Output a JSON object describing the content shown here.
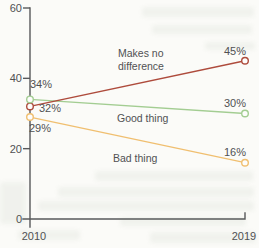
{
  "figure": {
    "background": "#fbfbf8"
  },
  "chart_data": {
    "type": "line",
    "x": [
      2010,
      2019
    ],
    "x_tick_labels": [
      "2010",
      "2019"
    ],
    "y_ticks": [
      0,
      20,
      40,
      60
    ],
    "ylim": [
      0,
      60
    ],
    "grid": false,
    "legend_position": "inline-labels",
    "axis_color": "#58595b",
    "text_color": "#505153",
    "marker_fill": "#fdfdfc",
    "series": [
      {
        "name": "Makes no difference",
        "label_lines": [
          "Makes no",
          "difference"
        ],
        "values": [
          32,
          45
        ],
        "point_labels": [
          "32%",
          "45%"
        ],
        "color": "#ae4b3c"
      },
      {
        "name": "Good thing",
        "label_lines": [
          "Good thing"
        ],
        "values": [
          34,
          30
        ],
        "point_labels": [
          "34%",
          "30%"
        ],
        "color": "#a3cd92"
      },
      {
        "name": "Bad thing",
        "label_lines": [
          "Bad thing"
        ],
        "values": [
          29,
          16
        ],
        "point_labels": [
          "29%",
          "16%"
        ],
        "color": "#f0bf70"
      }
    ]
  }
}
